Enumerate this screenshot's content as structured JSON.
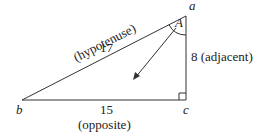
{
  "diagram": {
    "type": "right-triangle",
    "vertices": {
      "a": {
        "label": "a",
        "x": 186,
        "y": 16
      },
      "b": {
        "label": "b",
        "x": 22,
        "y": 100
      },
      "c": {
        "label": "c",
        "x": 186,
        "y": 100
      }
    },
    "angle_label": "A",
    "sides": {
      "hypotenuse": {
        "length": "17",
        "role": "(hypotenuse)"
      },
      "adjacent": {
        "length": "8",
        "role": "(adjacent)",
        "text": "8 (adjacent)"
      },
      "opposite": {
        "length": "15",
        "role": "(opposite)"
      }
    },
    "colors": {
      "line": "#333333",
      "text": "#222222"
    }
  }
}
